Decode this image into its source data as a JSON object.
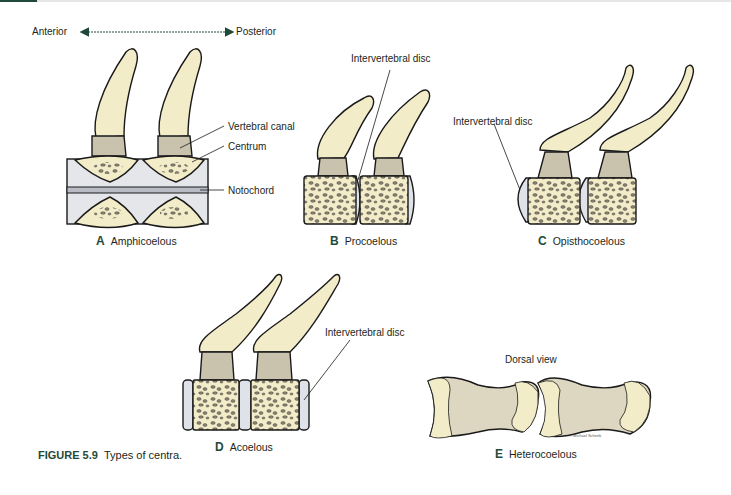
{
  "orientation": {
    "left_label": "Anterior",
    "right_label": "Posterior"
  },
  "panels": [
    {
      "letter": "A",
      "name": "Amphicoelous",
      "labels": [
        "Vertebral canal",
        "Centrum",
        "Notochord"
      ]
    },
    {
      "letter": "B",
      "name": "Procoelous",
      "labels": [
        "Intervertebral disc"
      ]
    },
    {
      "letter": "C",
      "name": "Opisthocoelous",
      "labels": [
        "Intervertebral disc"
      ]
    },
    {
      "letter": "D",
      "name": "Acoelous",
      "labels": [
        "Intervertebral disc"
      ]
    },
    {
      "letter": "E",
      "name": "Heterocoelous",
      "labels": [
        "Dorsal view"
      ]
    }
  ],
  "credit": "© Michael Schenk",
  "figure": {
    "number": "FIGURE 5.9",
    "caption": "Types of centra."
  },
  "colors": {
    "bone": "#f3ecc9",
    "canal": "#c9c3ad",
    "disc": "#dfe2e8",
    "notochord": "#b9bcc4",
    "accent": "#1f4a3a",
    "outline": "#1a1a1a"
  }
}
